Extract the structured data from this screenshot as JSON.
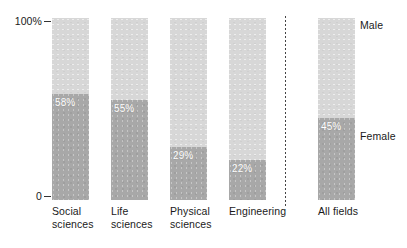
{
  "chart_data": {
    "type": "bar",
    "subtype": "100-percent-stacked-vertical",
    "title": "",
    "xlabel": "",
    "ylabel": "",
    "ylim": [
      0,
      100
    ],
    "grid": false,
    "legend_position": "right-inline",
    "categories": [
      "Social\nsciences",
      "Life\nsciences",
      "Physical\nsciences",
      "Engineering",
      "All fields"
    ],
    "series": [
      {
        "name": "Male",
        "values": [
          42,
          45,
          71,
          78,
          55
        ]
      },
      {
        "name": "Female",
        "values": [
          58,
          55,
          29,
          22,
          45
        ]
      }
    ],
    "data_labels": [
      "58%",
      "55%",
      "29%",
      "22%",
      "45%"
    ],
    "axis": {
      "ticks": [
        "100%",
        "0"
      ],
      "tick_top": "100%",
      "tick_bottom": "0"
    },
    "legend": {
      "male": "Male",
      "female": "Female"
    },
    "colors": {
      "male": "#d7d7d7",
      "female": "#a8a8a8",
      "text": "#1a1a1a",
      "label_text": "#ffffff",
      "divider": "#444444",
      "background": "#ffffff"
    },
    "divider": true
  },
  "bars": [
    {
      "name": "social-sciences",
      "category": "Social\nsciences",
      "male_pct": 42,
      "female_pct": 58,
      "label": "58%",
      "x": 52
    },
    {
      "name": "life-sciences",
      "category": "Life\nsciences",
      "male_pct": 45,
      "female_pct": 55,
      "label": "55%",
      "x": 111
    },
    {
      "name": "physical-sciences",
      "category": "Physical\nsciences",
      "male_pct": 71,
      "female_pct": 29,
      "label": "29%",
      "x": 170
    },
    {
      "name": "engineering",
      "category": "Engineering",
      "male_pct": 78,
      "female_pct": 22,
      "label": "22%",
      "x": 229
    },
    {
      "name": "all-fields",
      "category": "All fields",
      "male_pct": 55,
      "female_pct": 45,
      "label": "45%",
      "x": 318
    }
  ]
}
